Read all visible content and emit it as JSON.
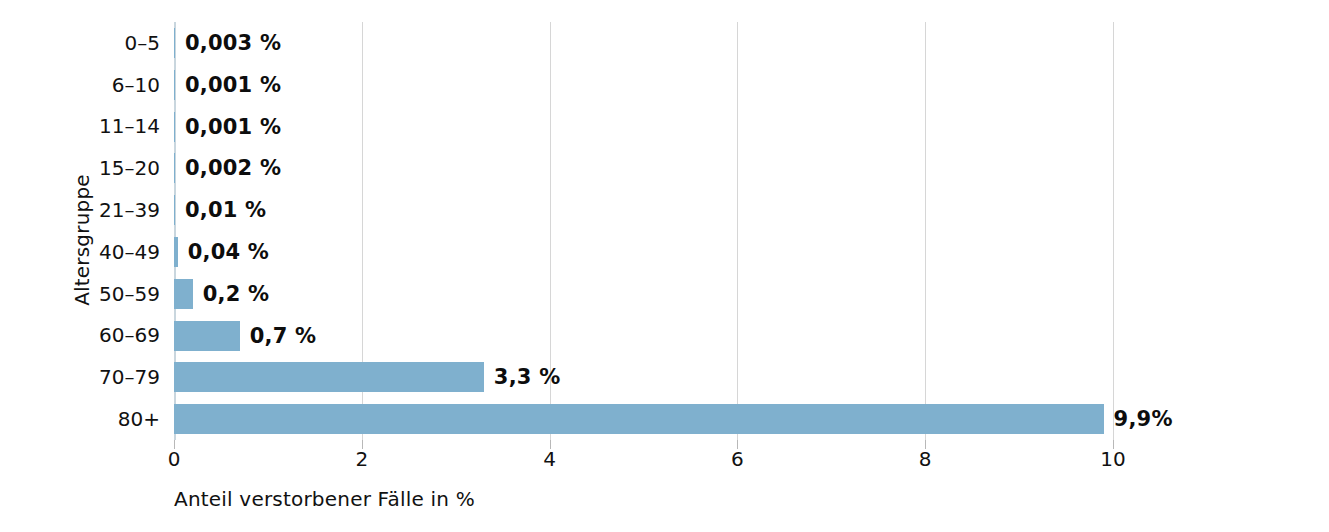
{
  "chart_data": {
    "type": "bar",
    "orientation": "horizontal",
    "title": "",
    "xlabel": "Anteil verstorbener Fälle in %",
    "ylabel": "Altersgruppe",
    "categories": [
      "0–5",
      "6–10",
      "11–14",
      "15–20",
      "21–39",
      "40–49",
      "50–59",
      "60–69",
      "70–79",
      "80+"
    ],
    "values": [
      0.003,
      0.001,
      0.001,
      0.002,
      0.01,
      0.04,
      0.2,
      0.7,
      3.3,
      9.9
    ],
    "value_labels": [
      "0,003 %",
      "0,001 %",
      "0,001 %",
      "0,002 %",
      "0,01 %",
      "0,04 %",
      "0,2 %",
      "0,7 %",
      "3,3 %",
      "9,9%"
    ],
    "xlim": [
      0,
      10
    ],
    "xticks": [
      0,
      2,
      4,
      6,
      8,
      10
    ],
    "xtick_labels": [
      "0",
      "2",
      "4",
      "6",
      "8",
      "10"
    ],
    "grid": "vertical",
    "legend": "none",
    "bar_color": "#7fb0ce",
    "gridline_color": "#d6d6d6",
    "text_color": "#111111"
  }
}
